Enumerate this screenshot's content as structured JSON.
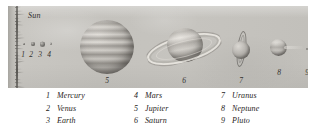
{
  "figure": {
    "sun_label": "Sun",
    "inner_planet_numbers": [
      "1",
      "2",
      "3",
      "4"
    ],
    "body_numbers": {
      "jupiter": "5",
      "saturn": "6",
      "uranus": "7",
      "neptune": "8",
      "pluto": "9"
    }
  },
  "legend": {
    "columns": [
      {
        "entries": [
          {
            "index": "1",
            "name": "Mercury"
          },
          {
            "index": "2",
            "name": "Venus"
          },
          {
            "index": "3",
            "name": "Earth"
          }
        ]
      },
      {
        "entries": [
          {
            "index": "4",
            "name": "Mars"
          },
          {
            "index": "5",
            "name": "Jupiter"
          },
          {
            "index": "6",
            "name": "Saturn"
          }
        ]
      },
      {
        "entries": [
          {
            "index": "7",
            "name": "Uranus"
          },
          {
            "index": "8",
            "name": "Neptune"
          },
          {
            "index": "9",
            "name": "Pluto"
          }
        ]
      }
    ]
  },
  "colors": {
    "plate_background": "#c6c4bf",
    "page_background": "#ffffff",
    "text": "#1f1d1b"
  }
}
